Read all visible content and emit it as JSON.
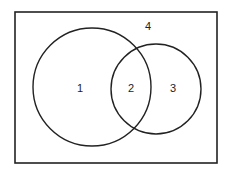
{
  "diagram": {
    "type": "venn",
    "universe": {
      "x": 15,
      "y": 12,
      "width": 202,
      "height": 151
    },
    "sets": [
      {
        "name": "large-circle",
        "cx": 92,
        "cy": 87,
        "r": 59
      },
      {
        "name": "small-circle",
        "cx": 156,
        "cy": 89,
        "r": 45
      }
    ],
    "regions": [
      {
        "id": "region-1",
        "label": "1",
        "x": 80,
        "y": 88
      },
      {
        "id": "region-2",
        "label": "2",
        "x": 131,
        "y": 88
      },
      {
        "id": "region-3",
        "label": "3",
        "x": 173,
        "y": 88
      },
      {
        "id": "region-4",
        "label": "4",
        "x": 148,
        "y": 26
      }
    ],
    "stroke_color": "#222222"
  }
}
